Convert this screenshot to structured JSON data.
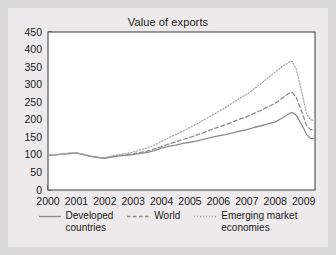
{
  "chart_data": {
    "type": "line",
    "title": "Value of exports",
    "xlabel": "",
    "ylabel": "",
    "xlim": [
      2000,
      2009.4
    ],
    "ylim": [
      0,
      450
    ],
    "yticks": [
      0,
      50,
      100,
      150,
      200,
      250,
      300,
      350,
      400,
      450
    ],
    "xticks": [
      2000,
      2001,
      2002,
      2003,
      2004,
      2005,
      2006,
      2007,
      2008,
      2009
    ],
    "grid": false,
    "legend_position": "bottom",
    "minor_tick_interval": 0.25,
    "note": "Index, 2000 = 100. Monthly/quarterly observations.",
    "x": [
      2000.0,
      2000.25,
      2000.5,
      2000.75,
      2001.0,
      2001.25,
      2001.5,
      2001.75,
      2002.0,
      2002.25,
      2002.5,
      2002.75,
      2003.0,
      2003.25,
      2003.5,
      2003.75,
      2004.0,
      2004.25,
      2004.5,
      2004.75,
      2005.0,
      2005.25,
      2005.5,
      2005.75,
      2006.0,
      2006.25,
      2006.5,
      2006.75,
      2007.0,
      2007.25,
      2007.5,
      2007.75,
      2008.0,
      2008.25,
      2008.5,
      2008.6,
      2008.75,
      2009.0,
      2009.1,
      2009.25,
      2009.4
    ],
    "series": [
      {
        "name": "Developed countries",
        "style": "solid",
        "color": "#8d8d8d",
        "values": [
          99,
          100,
          102,
          104,
          105,
          101,
          96,
          92,
          90,
          94,
          97,
          99,
          101,
          104,
          107,
          112,
          119,
          124,
          128,
          133,
          136,
          140,
          145,
          150,
          154,
          158,
          163,
          168,
          172,
          178,
          183,
          188,
          194,
          205,
          218,
          221,
          212,
          176,
          158,
          147,
          146
        ]
      },
      {
        "name": "World",
        "style": "dashed",
        "color": "#8d8d8d",
        "values": [
          99,
          100,
          102,
          104,
          105,
          101,
          96,
          93,
          91,
          95,
          98,
          100,
          103,
          107,
          111,
          117,
          124,
          131,
          137,
          144,
          150,
          157,
          164,
          172,
          179,
          186,
          194,
          202,
          209,
          218,
          227,
          237,
          247,
          262,
          276,
          278,
          262,
          208,
          184,
          172,
          171
        ]
      },
      {
        "name": "Emerging market economies",
        "style": "dotted",
        "color": "#a8a8a8",
        "values": [
          99,
          101,
          103,
          105,
          106,
          102,
          97,
          94,
          92,
          97,
          101,
          104,
          108,
          114,
          120,
          128,
          138,
          149,
          158,
          168,
          178,
          189,
          200,
          212,
          223,
          235,
          248,
          261,
          273,
          288,
          303,
          320,
          336,
          352,
          365,
          366,
          342,
          256,
          218,
          200,
          198
        ]
      }
    ]
  },
  "legend": [
    {
      "label": "Developed\ncountries",
      "style": "solid"
    },
    {
      "label": "World",
      "style": "dashed"
    },
    {
      "label": "Emerging market\neconomies",
      "style": "dotted"
    }
  ],
  "colors": {
    "figure_background": "#eceaea",
    "page_background": "#d9d9d9",
    "plot_background": "#ffffff",
    "axis": "#3a3a3a",
    "text": "#1b1b1b",
    "series_solid": "#8d8d8d",
    "series_dashed": "#8d8d8d",
    "series_dotted": "#a8a8a8"
  }
}
